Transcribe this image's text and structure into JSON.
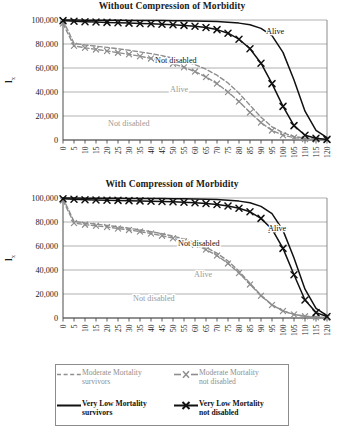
{
  "figure": {
    "panels": [
      {
        "title": "Without Compression of Morbidity"
      },
      {
        "title": "With Compression of Morbidity"
      }
    ]
  },
  "axis": {
    "y_label_main": "l",
    "y_label_sub": "x",
    "y_ticks": [
      "100,000",
      "80,000",
      "60,000",
      "40,000",
      "20,000",
      "0"
    ],
    "x_ticks": [
      "0",
      "5",
      "10",
      "15",
      "20",
      "25",
      "30",
      "35",
      "40",
      "45",
      "50",
      "55",
      "60",
      "65",
      "70",
      "75",
      "80",
      "85",
      "90",
      "95",
      "100",
      "105",
      "110",
      "115",
      "120"
    ]
  },
  "annotations": {
    "panel1": {
      "alive_black": "Alive",
      "notdisabled_black": "Not disabled",
      "alive_gray": "Alive",
      "notdisabled_gray": "Not disabled"
    },
    "panel2": {
      "alive_black": "Alive",
      "notdisabled_black": "Not disabled",
      "alive_gray": "Alive",
      "notdisabled_gray": "Not disabled"
    }
  },
  "legend": {
    "entries": [
      {
        "line1": "Moderate Mortality",
        "line2": "survivors",
        "style": "dashed",
        "color": "#8e8e8e",
        "marker": "none"
      },
      {
        "line1": "Moderate Mortality",
        "line2": "not disabled",
        "style": "dashed-marker",
        "color": "#8e8e8e",
        "marker": "x"
      },
      {
        "line1": "Very Low Mortality",
        "line2": "survivors",
        "style": "solid",
        "color": "#111111",
        "marker": "none"
      },
      {
        "line1": "Very Low Mortality",
        "line2": "not disabled",
        "style": "solid-marker",
        "color": "#111111",
        "marker": "x"
      }
    ]
  },
  "colors": {
    "moderate": "#8e8e8e",
    "very_low": "#111111",
    "gridline": "#9d9d9d",
    "frame": "#6f6f6f"
  },
  "chart_data": [
    {
      "type": "line",
      "title": "Without Compression of Morbidity",
      "xlabel": "",
      "ylabel": "lx",
      "xlim": [
        0,
        120
      ],
      "ylim": [
        0,
        100000
      ],
      "x": [
        0,
        5,
        10,
        15,
        20,
        25,
        30,
        35,
        40,
        45,
        50,
        55,
        60,
        65,
        70,
        75,
        80,
        85,
        90,
        95,
        100,
        105,
        110,
        115,
        120
      ],
      "grid": "horizontal",
      "legend_position": "below-figure",
      "series": [
        {
          "name": "Very Low Mortality survivors",
          "label_on_plot": "Alive",
          "color": "#111111",
          "style": "solid",
          "marker": "none",
          "values": [
            100000,
            99900,
            99850,
            99800,
            99750,
            99700,
            99650,
            99600,
            99550,
            99480,
            99400,
            99300,
            99150,
            98950,
            98650,
            98200,
            97400,
            96000,
            93000,
            87000,
            73000,
            50000,
            24000,
            8000,
            2000
          ]
        },
        {
          "name": "Very Low Mortality not disabled",
          "label_on_plot": "Not disabled",
          "color": "#111111",
          "style": "solid",
          "marker": "x",
          "values": [
            99500,
            99000,
            98600,
            98300,
            98000,
            97700,
            97400,
            97100,
            96800,
            96400,
            96000,
            95500,
            94800,
            93800,
            92000,
            89000,
            84000,
            76000,
            64000,
            47000,
            28000,
            12000,
            4000,
            1500,
            500
          ]
        },
        {
          "name": "Moderate Mortality survivors",
          "label_on_plot": "Alive",
          "color": "#8e8e8e",
          "style": "dashed",
          "marker": "none",
          "values": [
            100000,
            80500,
            79200,
            78200,
            77200,
            76000,
            74800,
            73400,
            72000,
            70200,
            68200,
            65800,
            62800,
            59000,
            54000,
            47500,
            39000,
            29000,
            19000,
            11000,
            6000,
            3000,
            1500,
            700,
            300
          ]
        },
        {
          "name": "Moderate Mortality not disabled",
          "label_on_plot": "Not disabled",
          "color": "#8e8e8e",
          "style": "dashed",
          "marker": "x",
          "values": [
            97000,
            78500,
            76800,
            75500,
            74200,
            72800,
            71400,
            69800,
            68000,
            66000,
            63600,
            60600,
            57000,
            52500,
            47000,
            40000,
            32000,
            23000,
            14500,
            8000,
            4000,
            2000,
            900,
            400,
            150
          ]
        }
      ]
    },
    {
      "type": "line",
      "title": "With Compression of Morbidity",
      "xlabel": "",
      "ylabel": "lx",
      "xlim": [
        0,
        120
      ],
      "ylim": [
        0,
        100000
      ],
      "x": [
        0,
        5,
        10,
        15,
        20,
        25,
        30,
        35,
        40,
        45,
        50,
        55,
        60,
        65,
        70,
        75,
        80,
        85,
        90,
        95,
        100,
        105,
        110,
        115,
        120
      ],
      "grid": "horizontal",
      "legend_position": "below-figure",
      "series": [
        {
          "name": "Very Low Mortality survivors",
          "label_on_plot": "Alive",
          "color": "#111111",
          "style": "solid",
          "marker": "none",
          "values": [
            100000,
            99900,
            99850,
            99800,
            99750,
            99700,
            99650,
            99600,
            99550,
            99480,
            99400,
            99300,
            99150,
            98950,
            98650,
            98200,
            97400,
            96000,
            93000,
            87000,
            73000,
            50000,
            24000,
            8000,
            2000
          ]
        },
        {
          "name": "Very Low Mortality not disabled",
          "label_on_plot": "Not disabled",
          "color": "#111111",
          "style": "solid",
          "marker": "x",
          "values": [
            99300,
            98900,
            98600,
            98400,
            98200,
            98000,
            97800,
            97600,
            97350,
            97100,
            96800,
            96450,
            96000,
            95400,
            94600,
            93400,
            91500,
            88500,
            83000,
            74000,
            58000,
            36000,
            15000,
            4500,
            1200
          ]
        },
        {
          "name": "Moderate Mortality survivors",
          "label_on_plot": "Alive",
          "color": "#8e8e8e",
          "style": "dashed",
          "marker": "none",
          "values": [
            100000,
            80500,
            79200,
            78200,
            77200,
            76000,
            74800,
            73400,
            72000,
            70200,
            68200,
            65800,
            62800,
            59000,
            54000,
            47500,
            39000,
            29000,
            19000,
            11000,
            6000,
            3000,
            1500,
            700,
            300
          ]
        },
        {
          "name": "Moderate Mortality not disabled",
          "label_on_plot": "Not disabled",
          "color": "#8e8e8e",
          "style": "dashed",
          "marker": "x",
          "values": [
            98000,
            79200,
            77800,
            76800,
            75800,
            74600,
            73400,
            72000,
            70400,
            68600,
            66500,
            64000,
            61000,
            57000,
            52000,
            45500,
            37500,
            28000,
            18500,
            10800,
            5800,
            2900,
            1400,
            650,
            280
          ]
        }
      ]
    }
  ]
}
